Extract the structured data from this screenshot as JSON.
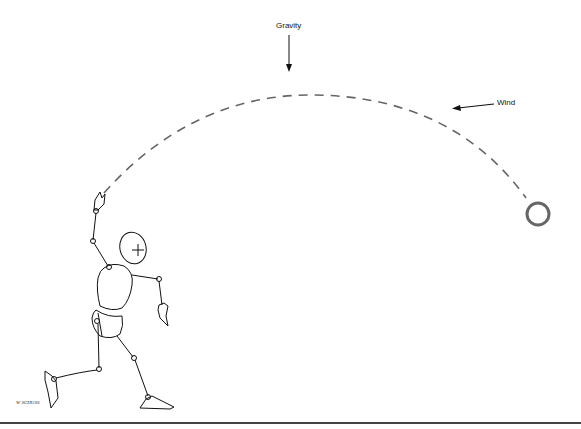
{
  "diagram": {
    "labels": {
      "gravity": "Gravity",
      "wind": "Wind"
    },
    "signature": "W SCHUSS",
    "colors": {
      "background": "#ffffff",
      "line": "#111111",
      "trajectory": "#666666",
      "ball": "#666666",
      "ground": "#444444"
    },
    "elements": [
      {
        "name": "gravity-arrow",
        "direction": "down"
      },
      {
        "name": "wind-arrow",
        "direction": "left"
      },
      {
        "name": "trajectory",
        "style": "dashed",
        "from": "thrower-hand",
        "to": "ball"
      },
      {
        "name": "ball",
        "shape": "circle"
      },
      {
        "name": "thrower-figure",
        "style": "mannequin sketch"
      },
      {
        "name": "ground-line"
      }
    ]
  }
}
